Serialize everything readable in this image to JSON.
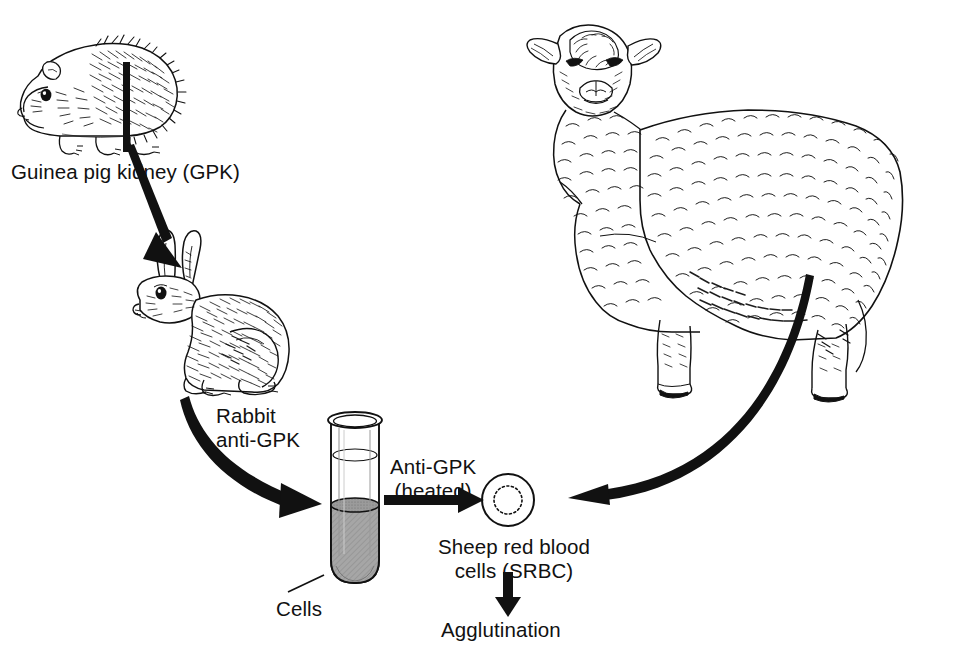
{
  "figure": {
    "domain": "diagram",
    "background_color": "#ffffff",
    "ink_color": "#111111",
    "liquid_color": "#9a9a9a"
  },
  "labels": {
    "gpk": "Guinea pig kidney (GPK)",
    "rabbit_anti_gpk": "Rabbit\nanti-GPK",
    "anti_gpk_heated": "Anti-GPK\n(heated)",
    "srbc": "Sheep red blood\ncells (SRBC)",
    "cells": "Cells",
    "agglutination": "Agglutination"
  },
  "illustrations": [
    {
      "name": "guinea-pig",
      "caption": "Guinea pig line drawing, facing left",
      "x": 14,
      "y": 22,
      "width": 160,
      "height": 120
    },
    {
      "name": "rabbit",
      "caption": "Rabbit line drawing, sitting, facing left",
      "x": 126,
      "y": 228,
      "width": 160,
      "height": 160
    },
    {
      "name": "sheep",
      "caption": "Sheep line drawing, standing, facing viewer-left",
      "x": 512,
      "y": 12,
      "width": 420,
      "height": 390
    },
    {
      "name": "test-tube",
      "caption": "Glass test tube half filled with grey cell suspension",
      "x": 328,
      "y": 414,
      "width": 54,
      "height": 170
    },
    {
      "name": "srbc-cell",
      "caption": "Sheep red blood cell: circle with dotted inner ring",
      "cx": 508,
      "cy": 500,
      "outer_radius": 26,
      "inner_radius": 14
    }
  ],
  "arrows": [
    {
      "name": "guinea-pig-to-rabbit",
      "from": "guinea-pig",
      "to": "rabbit",
      "style": "thick-tapered",
      "label": "gpk"
    },
    {
      "name": "rabbit-to-tube",
      "from": "rabbit",
      "to": "test-tube",
      "style": "thick-curved",
      "label": "rabbit_anti_gpk"
    },
    {
      "name": "tube-to-srbc",
      "from": "test-tube",
      "to": "srbc-cell",
      "style": "straight-horizontal",
      "label": "anti_gpk_heated"
    },
    {
      "name": "sheep-to-srbc",
      "from": "sheep",
      "to": "srbc-cell",
      "style": "thick-curved",
      "label": null
    },
    {
      "name": "srbc-to-agglutination",
      "from": "srbc-cell",
      "to": "agglutination",
      "style": "straight-vertical",
      "label": "agglutination"
    },
    {
      "name": "cells-leader-line",
      "from": "cells",
      "to": "test-tube",
      "style": "thin-leader",
      "label": "cells"
    }
  ]
}
